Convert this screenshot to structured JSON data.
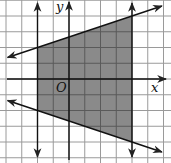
{
  "chart_data": {
    "type": "region",
    "title": "",
    "xlabel": "x",
    "ylabel": "y",
    "origin_label": "O",
    "grid": true,
    "grid_spacing_units": 1,
    "xlim": [
      -4,
      6
    ],
    "ylim": [
      -5,
      5
    ],
    "boundaries": [
      {
        "name": "left-vertical",
        "type": "vertical",
        "x": -2,
        "arrows": "both"
      },
      {
        "name": "right-vertical",
        "type": "vertical",
        "x": 4,
        "arrows": "both"
      },
      {
        "name": "upper-line",
        "type": "line",
        "slope": 0.3333,
        "intercept": 2.6667,
        "points": [
          [
            -2,
            2
          ],
          [
            4,
            4
          ]
        ],
        "arrows": "both"
      },
      {
        "name": "lower-line",
        "type": "line",
        "slope": -0.3333,
        "intercept": -2.6667,
        "points": [
          [
            -2,
            -2
          ],
          [
            4,
            -4
          ]
        ],
        "arrows": "both"
      }
    ],
    "shaded_region_vertices": [
      [
        -2,
        2
      ],
      [
        4,
        4
      ],
      [
        4,
        -4
      ],
      [
        -2,
        -2
      ]
    ],
    "colors": {
      "background": "#ffffff",
      "grid": "#9a9a9a",
      "shade": "#8a8a8a",
      "shade_grid": "#5a5a5a",
      "axis": "#111111"
    }
  },
  "labels": {
    "x_axis": "x",
    "y_axis": "y",
    "origin": "O"
  }
}
